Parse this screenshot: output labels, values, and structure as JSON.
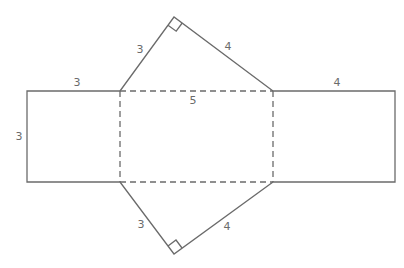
{
  "diagram": {
    "stroke_color": "#6b6b6b",
    "labels": {
      "left_square_top": "3",
      "left_square_side": "3",
      "top_triangle_left": "3",
      "top_triangle_right": "4",
      "middle_rect_top": "5",
      "right_rect_top": "4",
      "bottom_triangle_left": "3",
      "bottom_triangle_right": "4"
    }
  }
}
